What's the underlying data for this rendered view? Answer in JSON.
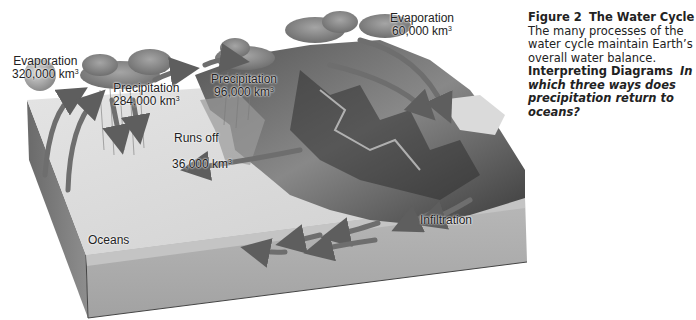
{
  "diagram": {
    "title": "The Water Cycle",
    "labels": {
      "evaporation_ocean": {
        "text": "Evaporation",
        "value": "320,000 km",
        "unit_exp": "3"
      },
      "precipitation_ocean": {
        "text": "Precipitation",
        "value": "284,000 km",
        "unit_exp": "3"
      },
      "precipitation_land": {
        "text": "Precipitation",
        "value": "96,000 km",
        "unit_exp": "3"
      },
      "evaporation_land": {
        "text": "Evaporation",
        "value": "60,000 km",
        "unit_exp": "3"
      },
      "runoff": {
        "text": "Runs off",
        "value": "36,000 km",
        "unit_exp": "3"
      },
      "infiltration": {
        "text": "Infiltration"
      },
      "oceans": {
        "text": "Oceans"
      }
    },
    "colors": {
      "ocean_surface": "#dcdcdc",
      "block_side": "#a9a9a9",
      "block_edge": "#555555",
      "arrow": "#6e6e6e",
      "cloud": "#8a8a8a",
      "mountain_dark": "#3a3a3a"
    }
  },
  "caption": {
    "figure_label": "Figure 2",
    "figure_title": "The Water Cycle",
    "body": "The many processes of the water cycle maintain Earth’s overall water balance.",
    "prompt_label": "Interpreting Diagrams",
    "prompt_question": "In which three ways does precipitation return to oceans?"
  }
}
